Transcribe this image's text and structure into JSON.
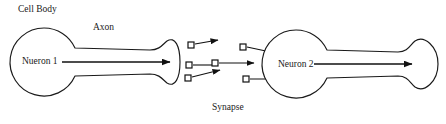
{
  "diagram": {
    "colors": {
      "background": "#ffffff",
      "outline": "#1a1a1a",
      "arrow": "#111111",
      "text": "#1a1a1a"
    },
    "labels": {
      "cell_body": "Cell Body",
      "axon": "Axon",
      "neuron_1": "Nueron 1",
      "neuron_2": "Neuron 2",
      "synapse": "Synapse"
    },
    "neurons": [
      {
        "id": "neuron-1",
        "label": "Nueron 1",
        "soma": {
          "cx": 44,
          "cy": 62,
          "rx": 34,
          "ry": 34
        },
        "axon_arrow": {
          "x1": 60,
          "y1": 62,
          "x2": 170,
          "y2": 62
        },
        "terminal": {
          "cx": 166,
          "cy": 62,
          "rx": 14,
          "ry": 22
        }
      },
      {
        "id": "neuron-2",
        "label": "Neuron 2",
        "soma": {
          "cx": 296,
          "cy": 64,
          "rx": 34,
          "ry": 34
        },
        "axon_arrow": {
          "x1": 312,
          "y1": 64,
          "x2": 415,
          "y2": 64
        },
        "terminal": {
          "cx": 422,
          "cy": 64,
          "rx": 16,
          "ry": 23
        }
      }
    ],
    "vesicles": [
      {
        "id": "vesicle-1",
        "x": 188,
        "y": 42,
        "size": 6
      },
      {
        "id": "vesicle-2",
        "x": 186,
        "y": 63,
        "size": 6
      },
      {
        "id": "vesicle-3",
        "x": 185,
        "y": 75,
        "size": 6
      },
      {
        "id": "vesicle-4",
        "x": 212,
        "y": 61,
        "size": 6
      },
      {
        "id": "vesicle-5",
        "x": 240,
        "y": 45,
        "size": 6
      },
      {
        "id": "vesicle-6",
        "x": 243,
        "y": 76,
        "size": 6
      }
    ],
    "synapse_arrows": [
      {
        "id": "arrow-1",
        "x1": 195,
        "y1": 44,
        "x2": 222,
        "y2": 40
      },
      {
        "id": "arrow-2",
        "x1": 193,
        "y1": 65,
        "x2": 226,
        "y2": 68
      },
      {
        "id": "arrow-3",
        "x1": 192,
        "y1": 77,
        "x2": 224,
        "y2": 70
      },
      {
        "id": "arrow-4",
        "x1": 219,
        "y1": 63,
        "x2": 258,
        "y2": 62
      },
      {
        "id": "arrow-5",
        "x1": 247,
        "y1": 47,
        "x2": 282,
        "y2": 55
      },
      {
        "id": "arrow-6",
        "x1": 250,
        "y1": 78,
        "x2": 285,
        "y2": 78
      }
    ],
    "label_positions": {
      "cell_body": {
        "x": 18,
        "y": 10
      },
      "axon": {
        "x": 93,
        "y": 28
      },
      "neuron_1": {
        "x": 22,
        "y": 62
      },
      "neuron_2": {
        "x": 278,
        "y": 65
      },
      "synapse": {
        "x": 212,
        "y": 108
      }
    }
  }
}
